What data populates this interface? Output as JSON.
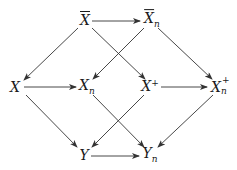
{
  "diagram": {
    "type": "commutative-diagram",
    "nodes": [
      {
        "id": "Xbar",
        "base": "X",
        "bar": true,
        "sub": "",
        "sup": "",
        "x": 85,
        "y": 20
      },
      {
        "id": "Xbar_n",
        "base": "X",
        "bar": true,
        "sub": "n",
        "sup": "",
        "x": 152,
        "y": 20
      },
      {
        "id": "X",
        "base": "X",
        "bar": false,
        "sub": "",
        "sup": "",
        "x": 15,
        "y": 87
      },
      {
        "id": "X_n",
        "base": "X",
        "bar": false,
        "sub": "n",
        "sup": "",
        "x": 87,
        "y": 87
      },
      {
        "id": "X_plus",
        "base": "X",
        "bar": false,
        "sub": "",
        "sup": "+",
        "x": 150,
        "y": 86
      },
      {
        "id": "X_n_plus",
        "base": "X",
        "bar": false,
        "sub": "n",
        "sup": "+",
        "x": 220,
        "y": 87
      },
      {
        "id": "Y",
        "base": "Y",
        "bar": false,
        "sub": "",
        "sup": "",
        "x": 84,
        "y": 155
      },
      {
        "id": "Y_n",
        "base": "Y",
        "bar": false,
        "sub": "n",
        "sup": "",
        "x": 150,
        "y": 155
      }
    ],
    "edges": [
      {
        "from": "Xbar",
        "to": "Xbar_n",
        "x1": 92,
        "y1": 21,
        "x2": 140,
        "y2": 21
      },
      {
        "from": "Xbar",
        "to": "X",
        "x1": 78,
        "y1": 28,
        "x2": 24,
        "y2": 80
      },
      {
        "from": "Xbar",
        "to": "X_plus",
        "x1": 92,
        "y1": 28,
        "x2": 145,
        "y2": 79
      },
      {
        "from": "Xbar_n",
        "to": "X_n",
        "x1": 144,
        "y1": 28,
        "x2": 93,
        "y2": 79
      },
      {
        "from": "Xbar_n",
        "to": "X_n_plus",
        "x1": 158,
        "y1": 28,
        "x2": 212,
        "y2": 79
      },
      {
        "from": "X",
        "to": "X_n",
        "x1": 24,
        "y1": 87,
        "x2": 76,
        "y2": 87
      },
      {
        "from": "X_plus",
        "to": "X_n_plus",
        "x1": 161,
        "y1": 87,
        "x2": 207,
        "y2": 87
      },
      {
        "from": "X",
        "to": "Y",
        "x1": 26,
        "y1": 95,
        "x2": 77,
        "y2": 147
      },
      {
        "from": "X_n",
        "to": "Y_n",
        "x1": 93,
        "y1": 95,
        "x2": 144,
        "y2": 147
      },
      {
        "from": "X_plus",
        "to": "Y",
        "x1": 144,
        "y1": 95,
        "x2": 92,
        "y2": 147
      },
      {
        "from": "X_n_plus",
        "to": "Y_n",
        "x1": 213,
        "y1": 95,
        "x2": 158,
        "y2": 147
      },
      {
        "from": "Y",
        "to": "Y_n",
        "x1": 91,
        "y1": 156,
        "x2": 139,
        "y2": 156
      }
    ],
    "colors": {
      "stroke": "#333333",
      "text": "#1a1a1a",
      "background": "#ffffff"
    }
  },
  "labels": {
    "Xbar": "X",
    "Xbar_n": "X",
    "X": "X",
    "X_n": "X",
    "X_plus": "X",
    "X_n_plus": "X",
    "Y": "Y",
    "Y_n": "Y",
    "sub_n": "n",
    "sup_plus": "+"
  }
}
